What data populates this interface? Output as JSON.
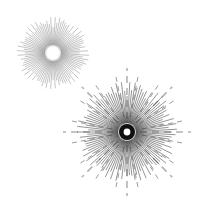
{
  "canvas": {
    "width": 202,
    "height": 207,
    "background": "#ffffff",
    "title": "Starburst sunburst illustration"
  },
  "palette": {
    "background": "#ffffff",
    "ray_dark": "#1a1a1a",
    "ray_mid": "#555555",
    "ray_light": "#9a9a9a",
    "ray_faint": "#c8c8c8",
    "core_dark": "#000000",
    "core_white": "#ffffff"
  },
  "bursts": [
    {
      "name": "small-starburst",
      "label": "Small starburst (upper left)",
      "center_x": 53,
      "center_y": 53,
      "inner_radius": 8,
      "outer_radius": 36,
      "ray_count": 96,
      "ray_color": "#7d7d7d",
      "ray_width": 0.45,
      "core_hole_radius": 6.2,
      "core_hole_color": "#ffffff",
      "halo_radius": 9.5,
      "halo_color": "#8a8a8a",
      "has_long_rays": false,
      "long_ray_count": 0
    },
    {
      "name": "large-starburst",
      "label": "Large starburst (lower right)",
      "center_x": 127,
      "center_y": 132,
      "inner_radius": 9,
      "outer_radius": 50,
      "ray_count": 112,
      "ray_color": "#2b2b2b",
      "ray_width": 0.5,
      "core_hole_radius": 3.4,
      "core_hole_color": "#ffffff",
      "halo_radius": 8.0,
      "halo_color": "#000000",
      "has_long_rays": true,
      "long_ray_count": 8,
      "long_ray_radius": 64,
      "long_ray_color": "#b4b4b4",
      "long_ray_width": 1.6,
      "long_ray_dash": "7 5",
      "long_ray_angles": [
        0,
        45,
        90,
        135,
        180,
        225,
        270,
        315
      ]
    }
  ],
  "medium_rays": {
    "name": "medium-rays",
    "label": "Medium-length dashed rays on large burst",
    "count": 16,
    "radius": 58,
    "color": "#9d9d9d",
    "width": 1.0,
    "dash": "5 4"
  }
}
